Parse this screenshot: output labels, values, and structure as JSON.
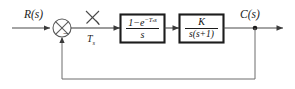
{
  "diagram": {
    "type": "control-system-block-diagram",
    "signals": {
      "input_label": "R(s)",
      "output_label": "C(s)",
      "sampler_label": "T",
      "sampler_label_sub": "s",
      "summing_sign_negative": "−"
    },
    "blocks": [
      {
        "name": "zero-order-hold",
        "numerator": "1−e",
        "numerator_exponent": "−Tₛs",
        "denominator": "s",
        "full": "(1−e^(−Tₛs))/s"
      },
      {
        "name": "plant",
        "numerator": "K",
        "denominator": "s(s+1)",
        "full": "K/(s(s+1))"
      }
    ],
    "feedback": {
      "type": "unity",
      "sign": "negative"
    },
    "colors": {
      "background": "#ffffff",
      "wire": "#4a4a4a",
      "block_border": "#1c1c1c",
      "text": "#111111"
    }
  }
}
